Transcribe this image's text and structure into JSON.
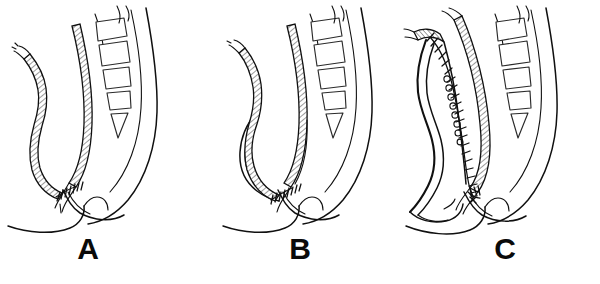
{
  "figure": {
    "background_color": "#ffffff",
    "ink_color": "#101010",
    "style": "black-and-white pen-and-ink line drawing",
    "width": 600,
    "height": 284,
    "panel_count": 3
  },
  "panels": [
    {
      "id": "panel-a",
      "label": "A",
      "label_x": 88,
      "label_y": 259,
      "origin_x": 0,
      "caption_text": "A",
      "description": "Straight end-to-end coloanal anastomosis",
      "structures": {
        "left_limb": "descending colon, cross-hatched serosal surface, narrow caliber",
        "right_limb": "rectal stump / anal canal, cross-hatched",
        "anastomosis": "short transverse interrupted suture line at the junction near the pelvic floor",
        "skeleton": "sacrum with four segmented vertebral bodies and coccyx",
        "pelvic_floor": "levator / perineal body outline sweeping left"
      },
      "suture_type": "interrupted transverse stitches",
      "suture_count": 7
    },
    {
      "id": "panel-b",
      "label": "B",
      "label_x": 300,
      "label_y": 259,
      "origin_x": 215,
      "caption_text": "B",
      "description": "Side-to-end (Baker) / transverse coloplasty anastomosis",
      "structures": {
        "left_limb": "descending colon with additional outer wall line forming a short reservoir",
        "right_limb": "rectal stump / anal canal, cross-hatched",
        "anastomosis": "transverse interrupted suture line lower in the pelvis",
        "skeleton": "sacrum with four segmented vertebral bodies and coccyx",
        "pelvic_floor": "levator / perineal body outline sweeping left"
      },
      "suture_type": "interrupted transverse stitches",
      "suture_count": 8
    },
    {
      "id": "panel-c",
      "label": "C",
      "label_x": 505,
      "label_y": 259,
      "origin_x": 400,
      "caption_text": "C",
      "description": "Colonic J-pouch reconstruction with long antimesenteric suture line",
      "structures": {
        "left_limb": "colonic J-pouch, wide double-walled limb, no hatching",
        "right_limb": "rectal stump / anal canal, cross-hatched",
        "anastomosis": "long running suture line down the full length of the pouch plus pouch-anal anastomosis",
        "skeleton": "sacrum with four segmented vertebral bodies and coccyx",
        "pelvic_floor": "levator / perineal body outline sweeping left"
      },
      "suture_type": "continuous running suture with ladder rungs",
      "suture_count": 24
    }
  ],
  "legend": {
    "labels": [
      "A",
      "B",
      "C"
    ]
  }
}
